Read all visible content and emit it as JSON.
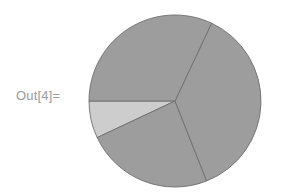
{
  "cell": {
    "out_label": "Out[4]=",
    "label_color": "#9a9a9a",
    "background": "#ffffff"
  },
  "chart_data": {
    "type": "pie",
    "title": "",
    "subtitle": "",
    "xlabel": "",
    "ylabel": "",
    "legend": "none",
    "grid": false,
    "labels_shown": false,
    "center": {
      "cx": 175,
      "cy": 101
    },
    "radius": 86,
    "start_angle_deg": 180,
    "direction": "counterclockwise",
    "edge_color": "#6e6e6e",
    "edge_width": 0.9,
    "categories": [
      "Slice 1",
      "Slice 2",
      "Slice 3",
      "Slice 4"
    ],
    "values": [
      0.07,
      0.24,
      0.37,
      0.32
    ],
    "percentages": [
      7,
      24,
      37,
      32
    ],
    "angles_deg": [
      25.2,
      86.4,
      133.2,
      115.2
    ],
    "colors": [
      "#cdcdcd",
      "#9d9d9d",
      "#9d9d9d",
      "#9d9d9d"
    ]
  }
}
